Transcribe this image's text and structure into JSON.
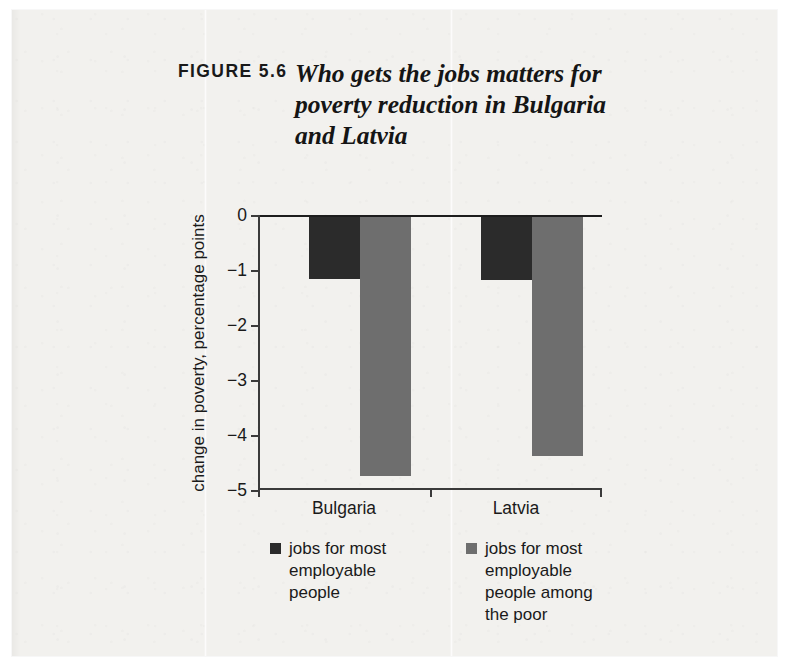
{
  "figure": {
    "label": "FIGURE 5.6",
    "title": "Who gets the jobs matters for poverty reduction in Bulgaria and Latvia"
  },
  "chart_data": {
    "type": "bar",
    "title": "Who gets the jobs matters for poverty reduction in Bulgaria and Latvia",
    "figure_label": "FIGURE 5.6",
    "categories": [
      "Bulgaria",
      "Latvia"
    ],
    "series": [
      {
        "name": "jobs for most employable people",
        "color": "#2b2b2b",
        "values": [
          -1.12,
          -1.15
        ]
      },
      {
        "name": "jobs for most employable people among the poor",
        "color": "#6e6e6e",
        "values": [
          -4.7,
          -4.34
        ]
      }
    ],
    "xlabel": "",
    "ylabel": "change in poverty, percentage points",
    "ylim": [
      -5,
      0
    ],
    "yticks": [
      0,
      -1,
      -2,
      -3,
      -4,
      -5
    ],
    "ytick_labels": [
      "0",
      "−1",
      "−2",
      "−3",
      "−4",
      "−5"
    ],
    "grid": false,
    "legend_position": "bottom"
  },
  "axis": {
    "y_label": "change in poverty, percentage points"
  },
  "legend": {
    "items": [
      {
        "label": "jobs for most employable people",
        "color": "#2b2b2b"
      },
      {
        "label": "jobs for most employable people among the poor",
        "color": "#6e6e6e"
      }
    ]
  },
  "colors": {
    "paper": "#f2f1ee",
    "ink": "#1a1a1a",
    "series_dark": "#2b2b2b",
    "series_gray": "#6e6e6e"
  }
}
